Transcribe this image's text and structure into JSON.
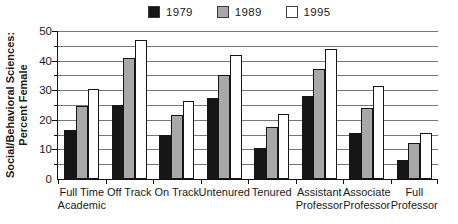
{
  "legend": {
    "items": [
      {
        "label": "1979",
        "color": "#161616"
      },
      {
        "label": "1989",
        "color": "#a8a8a8"
      },
      {
        "label": "1995",
        "color": "#ffffff"
      }
    ]
  },
  "ylabel_line1": "Social/Behavioral Sciences:",
  "ylabel_line2": "Percent Female",
  "chart_data": {
    "type": "bar",
    "title": "",
    "xlabel": "",
    "ylabel": "Social/Behavioral Sciences: Percent Female",
    "categories": [
      "Full Time\nAcademic",
      "Off Track",
      "On Track",
      "Untenured",
      "Tenured",
      "Assistant\nProfessor",
      "Associate\nProfessor",
      "Full\nProfessor"
    ],
    "series": [
      {
        "name": "1979",
        "color": "#161616",
        "values": [
          16.5,
          25,
          15,
          27.5,
          10.5,
          28,
          15.5,
          6.5
        ]
      },
      {
        "name": "1989",
        "color": "#a8a8a8",
        "values": [
          24.5,
          41,
          21.5,
          35,
          17.5,
          37,
          24,
          12
        ]
      },
      {
        "name": "1995",
        "color": "#ffffff",
        "values": [
          30.5,
          47,
          26.5,
          42,
          22,
          44,
          31.5,
          15.5
        ]
      }
    ],
    "ylim": [
      0,
      50
    ],
    "yticks": [
      0,
      10,
      20,
      30,
      40,
      50
    ],
    "grid_step": 5,
    "grid": true,
    "legend_position": "top"
  }
}
